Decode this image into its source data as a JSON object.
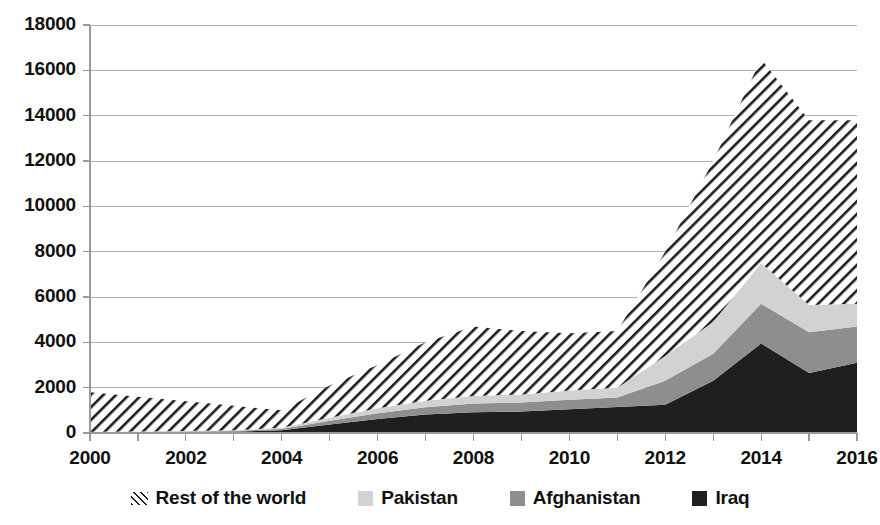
{
  "chart_data": {
    "type": "area",
    "stacked": true,
    "title": "",
    "subtitle": "",
    "xlabel": "",
    "ylabel": "",
    "xlim": [
      2000,
      2016
    ],
    "ylim": [
      0,
      18000
    ],
    "ytick_step": 2000,
    "grid": true,
    "legend_position": "bottom",
    "x": [
      2000,
      2001,
      2002,
      2003,
      2004,
      2005,
      2006,
      2007,
      2008,
      2009,
      2010,
      2011,
      2012,
      2013,
      2014,
      2015,
      2016
    ],
    "x_tick_labels": [
      "2000",
      "2002",
      "2004",
      "2006",
      "2008",
      "2010",
      "2012",
      "2014",
      "2016"
    ],
    "y_tick_labels": [
      "0",
      "2000",
      "4000",
      "6000",
      "8000",
      "10000",
      "12000",
      "14000",
      "16000",
      "18000"
    ],
    "series": [
      {
        "name": "Iraq",
        "color": "#1f1f1f",
        "pattern": "solid",
        "values": [
          20,
          30,
          40,
          60,
          120,
          380,
          620,
          820,
          920,
          950,
          1050,
          1150,
          1250,
          2300,
          3950,
          2650,
          3100
        ]
      },
      {
        "name": "Afghanistan",
        "color": "#8e8e8e",
        "pattern": "solid",
        "values": [
          20,
          20,
          25,
          30,
          60,
          160,
          250,
          320,
          380,
          400,
          420,
          420,
          1050,
          1200,
          1750,
          1800,
          1600
        ]
      },
      {
        "name": "Pakistan",
        "color": "#d2d2d2",
        "pattern": "solid",
        "values": [
          20,
          20,
          25,
          30,
          50,
          130,
          220,
          280,
          330,
          350,
          400,
          430,
          1100,
          1400,
          1800,
          1200,
          1000
        ]
      },
      {
        "name": "Rest of the world",
        "color": "#ffffff",
        "pattern": "diagonal-hatch",
        "values": [
          1740,
          1530,
          1310,
          1080,
          770,
          1430,
          1910,
          2580,
          3070,
          2800,
          2530,
          2500,
          4600,
          7100,
          9000,
          8150,
          8100
        ]
      }
    ],
    "totals": [
      1800,
      1600,
      1400,
      1200,
      1000,
      2100,
      3000,
      4000,
      4700,
      4500,
      4400,
      4500,
      8000,
      12000,
      16500,
      13800,
      13800
    ]
  },
  "legend": {
    "items": [
      {
        "label": "Rest of the world",
        "swatch": "hatch-swatch"
      },
      {
        "label": "Pakistan",
        "swatch": "pakistan-swatch"
      },
      {
        "label": "Afghanistan",
        "swatch": "afghanistan-swatch"
      },
      {
        "label": "Iraq",
        "swatch": "iraq-swatch"
      }
    ]
  },
  "colors": {
    "iraq": "#1f1f1f",
    "afghanistan": "#8e8e8e",
    "pakistan": "#d2d2d2",
    "rest_of_the_world": "#ffffff",
    "hatch_line": "#1c1c1c",
    "axis": "#9a9a9a",
    "grid": "#b3b3b3",
    "text": "#111111",
    "background": "#ffffff"
  }
}
